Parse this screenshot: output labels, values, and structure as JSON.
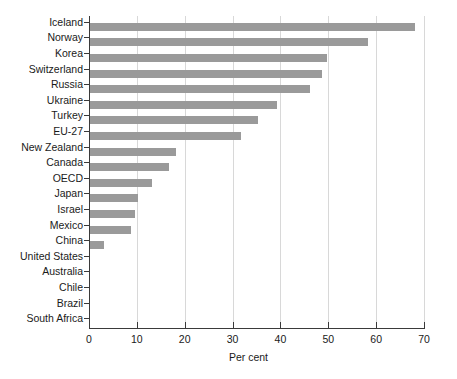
{
  "chart_data": {
    "type": "bar",
    "orientation": "horizontal",
    "title": "",
    "xlabel": "Per cent",
    "ylabel": "",
    "xlim": [
      0,
      70
    ],
    "xticks": [
      0,
      10,
      20,
      30,
      40,
      50,
      60,
      70
    ],
    "grid": true,
    "grid_axis": "x",
    "legend": null,
    "bar_color": "#9a9a9a",
    "axis_color": "#3a3a3a",
    "grid_color": "#d8d8d8",
    "categories": [
      "Iceland",
      "Norway",
      "Korea",
      "Switzerland",
      "Russia",
      "Ukraine",
      "Turkey",
      "EU-27",
      "New Zealand",
      "Canada",
      "OECD",
      "Japan",
      "Israel",
      "Mexico",
      "China",
      "United States",
      "Australia",
      "Chile",
      "Brazil",
      "South Africa"
    ],
    "values": [
      68.0,
      58.0,
      49.5,
      48.5,
      46.0,
      39.0,
      35.0,
      31.5,
      18.0,
      16.5,
      13.0,
      10.0,
      9.5,
      8.5,
      3.0,
      0.0,
      0.0,
      0.0,
      0.0,
      0.0
    ]
  }
}
